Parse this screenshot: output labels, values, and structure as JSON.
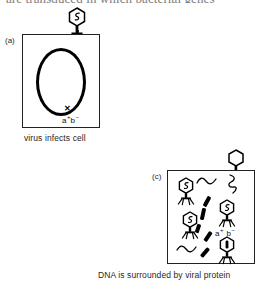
{
  "figure": {
    "clipped_heading": "are transduced in which bacterial genes",
    "type": "diagram"
  },
  "panel_a": {
    "label": "(a)",
    "caption": "virus infects cell",
    "genotype": {
      "gene_a": "a",
      "gene_a_sup": "+",
      "gene_b": "b",
      "gene_b_sup": "−"
    },
    "chromosome_name": "bacterial-chromosome-loop",
    "infecting_phage": {
      "name": "phage-injecting",
      "head_contents": "viral-dna-squiggle"
    },
    "injection_arrow": "dna-injection-arrow"
  },
  "panel_c": {
    "label": "(c)",
    "caption": "DNA is surrounded by viral protein",
    "genotype": {
      "gene_a": "a",
      "gene_a_sup": "+",
      "gene_b": "b",
      "gene_b_sup": "−"
    },
    "top_phage": {
      "name": "empty-phage-on-corner",
      "head_contents": "empty"
    },
    "phages_inside": [
      {
        "name": "phage-assembled-1",
        "head_contents": "viral-dna-squiggle"
      },
      {
        "name": "phage-assembled-2",
        "head_contents": "viral-dna-squiggle"
      },
      {
        "name": "phage-assembled-3",
        "head_contents": "viral-dna-squiggle"
      },
      {
        "name": "transducing-particle",
        "head_contents": "bacterial-dna-fragment"
      }
    ],
    "dna_fragments_count": 5,
    "viral_dna_squiggles_count": 3
  },
  "colors": {
    "ink": "#000000",
    "outline": "#222222",
    "clipped_text": "#7d7d7d",
    "background": "#ffffff"
  }
}
